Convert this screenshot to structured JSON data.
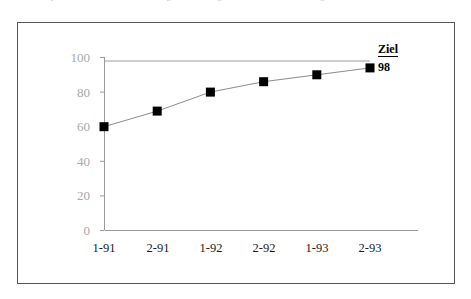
{
  "page": {
    "clipped_header_text": "Bereich, je nach dem, ob ... Verbesserungsziel für einige Kennzahl, in der allerdings"
  },
  "figure": {
    "target_annotation": {
      "label": "Ziel",
      "value": "98"
    }
  },
  "chart_data": {
    "type": "line",
    "title": "",
    "subtitle": "",
    "xlabel": "",
    "ylabel": "",
    "categories": [
      "1-91",
      "2-91",
      "1-92",
      "2-92",
      "1-93",
      "2-93"
    ],
    "values": [
      60,
      69,
      80,
      86,
      90,
      94
    ],
    "series": [
      {
        "name": "",
        "values": [
          60,
          69,
          80,
          86,
          90,
          94
        ],
        "marker": "square",
        "marker_color": "#000000",
        "line_color": "#8c8c8c"
      }
    ],
    "ylim": [
      0,
      100
    ],
    "yticks": [
      0,
      20,
      40,
      60,
      80,
      100
    ],
    "ytick_labels": [
      "0",
      "20",
      "40",
      "60",
      "80",
      "100"
    ],
    "xtick_labels": [
      "1-91",
      "2-91",
      "1-92",
      "2-92",
      "1-93",
      "2-93"
    ],
    "grid": false,
    "legend": false,
    "legend_position": "none",
    "annotations": [
      {
        "type": "target-line",
        "label": "Ziel",
        "value": 98,
        "orientation": "horizontal",
        "color": "#9a9a9a"
      }
    ],
    "axis_color": "#9a9a9a",
    "ytick_label_color": "#a8a8a8",
    "xtick_label_color": "#1a1a1a",
    "background": "#ffffff"
  }
}
